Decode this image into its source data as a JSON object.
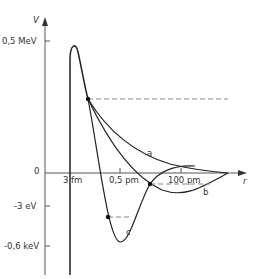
{
  "axes": {
    "y_label": "V",
    "x_label": "r",
    "y_ticks": [
      "0,5 MeV",
      "0",
      "-3 eV",
      "-0,6 keV"
    ],
    "x_ticks": [
      "3 fm",
      "0,5 pm",
      "100 pm"
    ]
  },
  "curves": [
    {
      "id": "a",
      "label": "a"
    },
    {
      "id": "b",
      "label": "b"
    },
    {
      "id": "c",
      "label": "c"
    }
  ],
  "colors": {
    "line": "#222222",
    "dashed": "#888888",
    "axis": "#555555"
  }
}
